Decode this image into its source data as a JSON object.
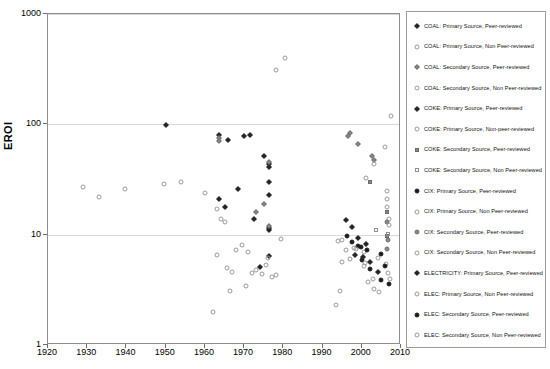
{
  "chart_data": {
    "type": "scatter",
    "title": "",
    "xlabel": "",
    "ylabel": "EROI",
    "xlim": [
      1920,
      2010
    ],
    "ylim": [
      1,
      1000
    ],
    "yscale": "log",
    "xticks": [
      1920,
      1930,
      1940,
      1950,
      1960,
      1970,
      1980,
      1990,
      2000,
      2010
    ],
    "yticks": [
      1,
      10,
      100,
      1000
    ],
    "grid": "horizontal",
    "legend_position": "right",
    "series": [
      {
        "name": "COAL: Primary Source, Peer-reviewed",
        "key": "coal-primary-peer",
        "marker": "diamond-fill",
        "points": [
          [
            1950.0,
            98
          ],
          [
            1963.6,
            80
          ],
          [
            1966.0,
            72
          ],
          [
            1970.0,
            78
          ],
          [
            1971.5,
            80
          ],
          [
            1975.0,
            52
          ],
          [
            1976.4,
            44
          ],
          [
            1976.4,
            41
          ],
          [
            1976.4,
            30
          ],
          [
            1976.4,
            23
          ],
          [
            1976.4,
            11.5
          ],
          [
            1976.4,
            11.0
          ],
          [
            1976.4,
            6.4
          ],
          [
            1968.5,
            26
          ],
          [
            1963.5,
            21
          ],
          [
            1965.0,
            18
          ],
          [
            1972.5,
            14
          ],
          [
            1974.0,
            5.1
          ]
        ]
      },
      {
        "name": "COAL: Primary Source, Non Peer-reviewed",
        "key": "coal-primary-nonpeer",
        "marker": "circle-open",
        "points": [
          [
            1929.0,
            27
          ],
          [
            1933.0,
            22
          ],
          [
            1939.5,
            26
          ],
          [
            1949.5,
            29
          ],
          [
            1954.0,
            30
          ],
          [
            1960.0,
            24
          ],
          [
            1963.0,
            17
          ],
          [
            1964.0,
            14
          ],
          [
            1965.0,
            13
          ],
          [
            1963.0,
            6.5
          ],
          [
            1965.5,
            5.0
          ],
          [
            1967.0,
            4.6
          ],
          [
            1968.0,
            7.2
          ],
          [
            1969.5,
            8.0
          ],
          [
            1971.0,
            7.0
          ],
          [
            1972.0,
            4.5
          ],
          [
            1973.0,
            4.8
          ],
          [
            1974.5,
            4.4
          ],
          [
            1975.5,
            5.3
          ],
          [
            1976.0,
            6.1
          ],
          [
            1977.0,
            4.1
          ],
          [
            1978.0,
            4.3
          ],
          [
            1979.5,
            9.1
          ],
          [
            1962.0,
            2.0
          ],
          [
            1966.5,
            3.1
          ],
          [
            1970.5,
            3.4
          ]
        ]
      },
      {
        "name": "COAL: Secondary Source, Peer-reviewed",
        "key": "coal-secondary-peer",
        "marker": "diamond-grey",
        "points": [
          [
            1963.6,
            76
          ],
          [
            1963.6,
            71
          ],
          [
            1976.4,
            46
          ],
          [
            1976.4,
            12.0
          ],
          [
            1975.0,
            19
          ],
          [
            1973.0,
            16
          ],
          [
            1997.0,
            83
          ],
          [
            1996.5,
            79
          ],
          [
            1999.0,
            66
          ],
          [
            2002.5,
            52
          ],
          [
            2003.0,
            48
          ]
        ]
      },
      {
        "name": "COAL: Secondary Source, Non Peer-reviewed",
        "key": "coal-secondary-nonpeer",
        "marker": "circle-open",
        "points": [
          [
            1978.0,
            310
          ],
          [
            1980.5,
            400
          ],
          [
            2007.5,
            118
          ],
          [
            2006.0,
            62
          ],
          [
            2003.0,
            44
          ],
          [
            2001.0,
            33
          ],
          [
            2006.5,
            25
          ],
          [
            2006.5,
            21
          ],
          [
            2006.5,
            18
          ],
          [
            2007.0,
            14
          ],
          [
            1993.5,
            2.3
          ]
        ]
      },
      {
        "name": "COKE: Primary Source, Peer-reviewed",
        "key": "coke-primary-peer",
        "marker": "diamond-fill",
        "points": [
          [
            1996.0,
            13.5
          ],
          [
            1997.5,
            11.8
          ],
          [
            1999.0,
            9.4
          ],
          [
            2001.0,
            8.3
          ]
        ]
      },
      {
        "name": "COKE: Primary Source, Non-peer-reviewed",
        "key": "coke-primary-nonpeer",
        "marker": "circle-open",
        "points": [
          [
            1995.0,
            9.0
          ],
          [
            1998.0,
            7.6
          ],
          [
            2000.5,
            6.9
          ],
          [
            2004.0,
            6.2
          ]
        ]
      },
      {
        "name": "COKE: Secondary Source, Peer-reviewed",
        "key": "coke-secondary-peer",
        "marker": "square-grey",
        "points": [
          [
            2002.0,
            30
          ],
          [
            2006.5,
            16
          ],
          [
            2006.5,
            9.8
          ]
        ]
      },
      {
        "name": "COKE: Secondary Source, Non Peer-reviewed",
        "key": "coke-secondary-nonpeer",
        "marker": "square-open",
        "points": [
          [
            2003.5,
            11.0
          ],
          [
            2006.8,
            10.2
          ]
        ]
      },
      {
        "name": "CIX: Primary Source, Peer-reviewed",
        "key": "cix-primary-peer",
        "marker": "circle-fill",
        "points": [
          [
            1996.2,
            9.8
          ],
          [
            1997.6,
            8.6
          ],
          [
            1999.0,
            7.9
          ],
          [
            1999.8,
            7.7
          ],
          [
            2001.2,
            7.2
          ],
          [
            2000.0,
            5.9
          ],
          [
            2002.0,
            4.9
          ],
          [
            2004.8,
            6.7
          ]
        ]
      },
      {
        "name": "CIX: Primary Source, Non Peer-reviewed",
        "key": "cix-primary-nonpeer",
        "marker": "circle-open",
        "points": [
          [
            1994.0,
            8.8
          ],
          [
            1996.0,
            7.3
          ],
          [
            1998.5,
            7.4
          ],
          [
            1995.0,
            5.7
          ],
          [
            2000.5,
            5.2
          ],
          [
            2002.8,
            4.0
          ],
          [
            1994.5,
            3.1
          ]
        ]
      },
      {
        "name": "CIX: Secondary Source, Peer-reviewed",
        "key": "cix-secondary-peer",
        "marker": "circle-grey",
        "points": [
          [
            2006.5,
            13.0
          ],
          [
            2006.8,
            8.9
          ],
          [
            2006.5,
            7.4
          ]
        ]
      },
      {
        "name": "CIX: Secondary Source, Non Peer-reviewed",
        "key": "cix-secondary-nonpeer",
        "marker": "circle-open",
        "points": [
          [
            2007.0,
            12.2
          ],
          [
            2006.2,
            5.4
          ],
          [
            2007.2,
            4.0
          ]
        ]
      },
      {
        "name": "ELECTRICITY: Primary Source, Peer-reviewed",
        "key": "electricity-primary-peer",
        "marker": "diamond-fill",
        "points": [
          [
            1998.2,
            6.5
          ],
          [
            2000.4,
            6.3
          ],
          [
            2002.2,
            5.6
          ],
          [
            2004.2,
            4.6
          ]
        ]
      },
      {
        "name": "ELEC: Primary Source, Non Peer-reviewed",
        "key": "elec-primary-nonpeer",
        "marker": "circle-open",
        "points": [
          [
            1997.0,
            6.0
          ],
          [
            2000.8,
            5.5
          ],
          [
            2001.5,
            3.7
          ],
          [
            2003.0,
            3.2
          ]
        ]
      },
      {
        "name": "ELEC: Secondary Source, Peer-reviewed",
        "key": "elec-secondary-peer",
        "marker": "circle-fill",
        "points": [
          [
            2005.8,
            5.2
          ],
          [
            2007.0,
            3.6
          ],
          [
            2005.0,
            3.9
          ]
        ]
      },
      {
        "name": "ELEC: Secondary Source, Non Peer-reviewed",
        "key": "elec-secondary-nonpeer",
        "marker": "circle-open",
        "points": [
          [
            2006.8,
            4.5
          ],
          [
            2004.5,
            3.0
          ]
        ]
      }
    ]
  }
}
